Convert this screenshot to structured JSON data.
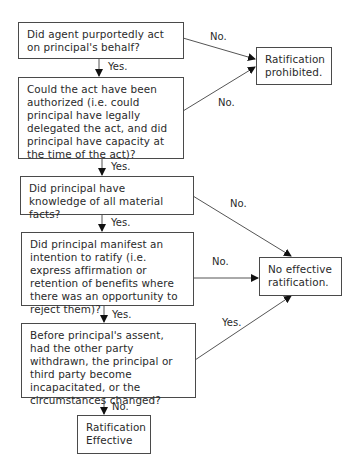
{
  "nodes": {
    "q1": "Did agent purportedly act on principal's behalf?",
    "q2": "Could the act have been authorized (i.e. could principal have legally delegated the act, and did principal have capacity at the time of the act)?",
    "q3": "Did principal have knowledge of all material facts?",
    "q4": "Did principal manifest an intention to ratify (i.e. express affirmation or retention of benefits where there was an opportunity to reject them)?",
    "q5": "Before principal's assent, had the other party withdrawn, the principal or third party become incapacitated, or the circumstances changed?",
    "prohibited": "Ratification prohibited.",
    "no_effective": "No effective ratification.",
    "effective": "Ratification Effective"
  },
  "edges": {
    "q1_no": "No.",
    "q1_yes": "Yes.",
    "q2_no": "No.",
    "q2_yes": "Yes.",
    "q3_no": "No.",
    "q3_yes": "Yes.",
    "q4_no": "No.",
    "q4_yes": "Yes.",
    "q5_yes": "Yes.",
    "q5_no": "No."
  }
}
